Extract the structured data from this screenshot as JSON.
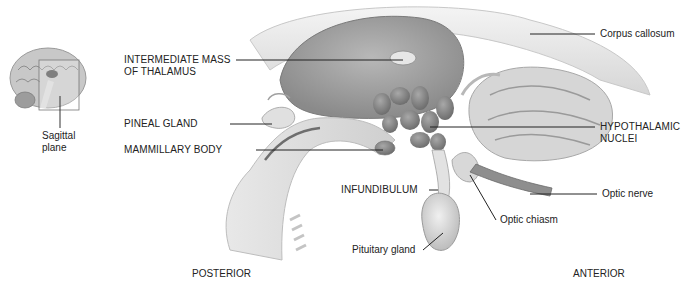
{
  "figure": {
    "inset": {
      "label_line1": "Sagittal",
      "label_line2": "plane"
    },
    "labels_left": [
      {
        "id": "intermediate_mass",
        "line1": "INTERMEDIATE MASS",
        "line2": "OF THALAMUS"
      },
      {
        "id": "pineal_gland",
        "line1": "PINEAL GLAND"
      },
      {
        "id": "mammillary_body",
        "line1": "MAMMILLARY BODY"
      },
      {
        "id": "infundibulum",
        "line1": "INFUNDIBULUM"
      },
      {
        "id": "pituitary_gland",
        "line1": "Pituitary gland"
      }
    ],
    "labels_right": [
      {
        "id": "corpus_callosum",
        "line1": "Corpus callosum"
      },
      {
        "id": "hypothalamic_nuclei",
        "line1": "HYPOTHALAMIC",
        "line2": "NUCLEI"
      },
      {
        "id": "optic_nerve",
        "line1": "Optic nerve"
      },
      {
        "id": "optic_chiasm",
        "line1": "Optic chiasm"
      }
    ],
    "orientation": {
      "posterior": "POSTERIOR",
      "anterior": "ANTERIOR"
    }
  }
}
